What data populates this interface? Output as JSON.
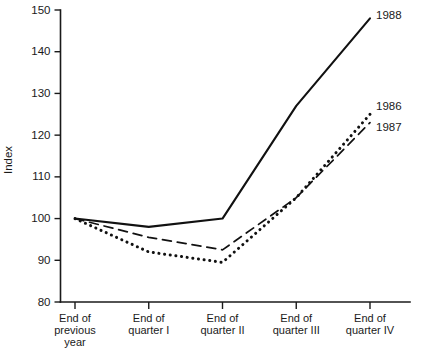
{
  "chart_data": {
    "type": "line",
    "title": "",
    "xlabel": "",
    "ylabel": "Index",
    "ylim": [
      80,
      150
    ],
    "yticks": [
      80,
      90,
      100,
      110,
      120,
      130,
      140,
      150
    ],
    "ytick_labels": [
      "80",
      "90",
      "100",
      "110",
      "120",
      "130",
      "140",
      "150"
    ],
    "grid": false,
    "legend_position": "right-inline-end-of-line",
    "categories": [
      "End of previous year",
      "End of quarter I",
      "End of quarter II",
      "End of quarter III",
      "End of quarter IV"
    ],
    "category_lines": [
      [
        "End of",
        "previous",
        "year"
      ],
      [
        "End of",
        "quarter I"
      ],
      [
        "End of",
        "quarter II"
      ],
      [
        "End of",
        "quarter III"
      ],
      [
        "End of",
        "quarter IV"
      ]
    ],
    "series": [
      {
        "name": "1986",
        "style": "dotted",
        "values": [
          100,
          92,
          89.5,
          105,
          125
        ]
      },
      {
        "name": "1987",
        "style": "dashed",
        "values": [
          100,
          95.5,
          92.5,
          105,
          123
        ]
      },
      {
        "name": "1988",
        "style": "solid",
        "values": [
          100,
          98,
          100,
          127,
          148
        ]
      }
    ]
  },
  "colors": {
    "axis": "#1a1a1a",
    "series": "#111111",
    "background": "#ffffff"
  }
}
